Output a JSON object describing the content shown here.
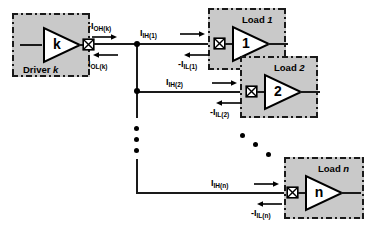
{
  "diagram": {
    "driver": {
      "box_label_prefix": "Driver",
      "box_label_index": "k",
      "symbol_text": "k",
      "output_current_high": "-I",
      "output_current_high_sub": "OH(k)",
      "output_current_low": "I",
      "output_current_low_sub": "OL(k)"
    },
    "loads": [
      {
        "box_label_prefix": "Load",
        "box_label_index": "1",
        "symbol_text": "1",
        "input_current_high": "I",
        "input_current_high_sub": "IH(1)",
        "input_current_low": "-I",
        "input_current_low_sub": "IL(1)"
      },
      {
        "box_label_prefix": "Load",
        "box_label_index": "2",
        "symbol_text": "2",
        "input_current_high": "I",
        "input_current_high_sub": "IH(2)",
        "input_current_low": "-I",
        "input_current_low_sub": "IL(2)"
      },
      {
        "box_label_prefix": "Load",
        "box_label_index": "n",
        "symbol_text": "n",
        "input_current_high": "I",
        "input_current_high_sub": "IH(n)",
        "input_current_low": "-I",
        "input_current_low_sub": "IL(n)"
      }
    ],
    "colors": {
      "block_fill": "#c9c9c9",
      "line": "#1a1a1a",
      "background": "#ffffff",
      "text": "#000000"
    },
    "icons": {
      "port": "crossed-box-port-icon",
      "junction": "junction-dot-icon",
      "arrow_right": "arrow-right-icon",
      "arrow_left": "arrow-left-icon",
      "ellipsis_vertical": "vertical-ellipsis-icon",
      "ellipsis_diagonal": "diagonal-ellipsis-icon"
    }
  }
}
